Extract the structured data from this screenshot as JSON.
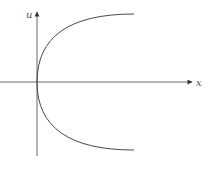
{
  "diagram": {
    "type": "parabola-plot",
    "axes": {
      "horizontal": {
        "label": "x",
        "direction": "right"
      },
      "vertical": {
        "label": "u",
        "direction": "up"
      }
    },
    "curve": {
      "shape": "parabola opening right",
      "vertex": "origin"
    },
    "colors": {
      "line": "#333333",
      "label": "#555555",
      "background": "#ffffff"
    }
  }
}
